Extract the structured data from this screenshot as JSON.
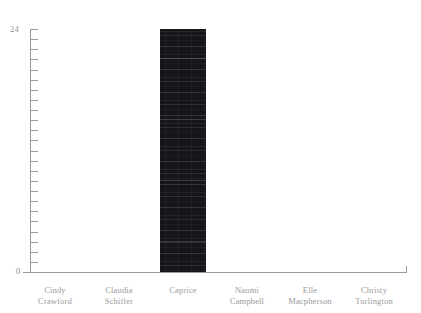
{
  "chart_data": {
    "type": "bar",
    "title": "",
    "subtitle": "",
    "xlabel": "",
    "ylabel": "",
    "categories": [
      "Cindy\nCrawford",
      "Claudia\nSchiffer",
      "Caprice",
      "Naomi\nCampbell",
      "Elle\nMacpherson",
      "Christy\nTurlington"
    ],
    "values": [
      0,
      0,
      24,
      0,
      0,
      0
    ],
    "ylim": [
      0,
      24
    ],
    "y_tick_labels": [
      "0",
      "24"
    ],
    "y_tick_interval": 1,
    "y_tick_count": 24,
    "grid": false,
    "legend": false,
    "legend_position": "none",
    "bar_color": "#16161a",
    "axis_color": "#9a9a9a",
    "label_color": "#9b9b9b",
    "background_color": "#ffffff"
  },
  "axis": {
    "y_max_label": "24",
    "y_min_label": "0"
  }
}
